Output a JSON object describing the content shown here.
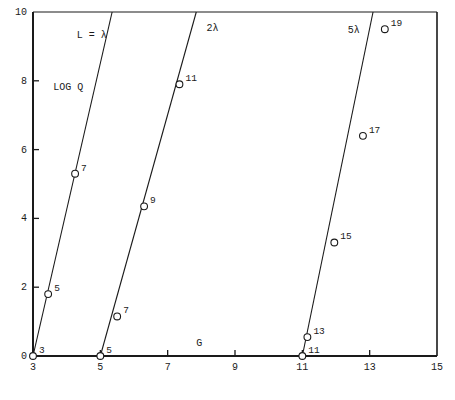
{
  "chart_data": {
    "type": "scatter",
    "title": "",
    "xlabel": "G",
    "ylabel": "LOG Q",
    "xlim": [
      3,
      15
    ],
    "ylim": [
      0,
      10
    ],
    "xticks": [
      3,
      5,
      7,
      9,
      11,
      13,
      15
    ],
    "xtick_labels": [
      "3",
      "5",
      "7",
      "9",
      "11",
      "13",
      "15"
    ],
    "yticks": [
      0,
      2,
      4,
      6,
      8,
      10
    ],
    "ytick_labels": [
      "0",
      "2",
      "4",
      "6",
      "8",
      "10"
    ],
    "grid": false,
    "legend": "none",
    "annotations": [
      {
        "text": "L = λ",
        "x": 4.3,
        "y": 9.3
      },
      {
        "text": "LOG Q",
        "x": 3.6,
        "y": 7.8
      },
      {
        "text": "2λ",
        "x": 8.15,
        "y": 9.5
      },
      {
        "text": "5λ",
        "x": 12.35,
        "y": 9.45
      },
      {
        "text": "G",
        "x": 7.85,
        "y": 0.35
      }
    ],
    "series": [
      {
        "name": "L = λ",
        "line": {
          "x": [
            3.0,
            5.35
          ],
          "y": [
            0.0,
            10.0
          ]
        },
        "points": [
          {
            "x": 3.0,
            "y": 0.0,
            "label": "3"
          },
          {
            "x": 3.45,
            "y": 1.8,
            "label": "5"
          },
          {
            "x": 4.25,
            "y": 5.3,
            "label": "7"
          }
        ]
      },
      {
        "name": "2λ",
        "line": {
          "x": [
            5.0,
            7.85
          ],
          "y": [
            0.0,
            10.0
          ]
        },
        "points": [
          {
            "x": 5.0,
            "y": 0.0,
            "label": "5"
          },
          {
            "x": 5.5,
            "y": 1.15,
            "label": "7"
          },
          {
            "x": 6.3,
            "y": 4.35,
            "label": "9"
          },
          {
            "x": 7.35,
            "y": 7.9,
            "label": "11"
          }
        ]
      },
      {
        "name": "5λ",
        "line": {
          "x": [
            11.0,
            13.1
          ],
          "y": [
            0.0,
            10.0
          ]
        },
        "points": [
          {
            "x": 11.0,
            "y": 0.0,
            "label": "11"
          },
          {
            "x": 11.15,
            "y": 0.55,
            "label": "13"
          },
          {
            "x": 11.95,
            "y": 3.3,
            "label": "15"
          },
          {
            "x": 12.8,
            "y": 6.4,
            "label": "17"
          },
          {
            "x": 13.45,
            "y": 9.5,
            "label": "19"
          }
        ]
      }
    ],
    "style": {
      "axis_color": "#1a1a1a",
      "line_color": "#1a1a1a",
      "marker_fill": "#ffffff",
      "marker_edge": "#1a1a1a",
      "background": "#ffffff"
    }
  }
}
